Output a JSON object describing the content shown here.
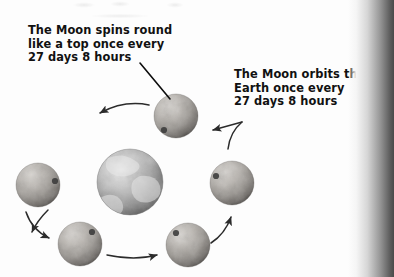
{
  "page": {
    "background_color": "#fdfdfd",
    "width": 394,
    "height": 277
  },
  "captions": [
    {
      "id": "spin",
      "text": "The Moon spins round\nlike a top once every\n27 days 8 hours",
      "lines": [
        "The Moon spins round",
        "like a top once every",
        "27 days 8 hours"
      ],
      "color": "#111111",
      "points_to": "top-moon"
    },
    {
      "id": "orbit",
      "text": "The Moon orbits the\nEarth once every\n27 days 8 hours",
      "lines": [
        "The Moon orbits the",
        "Earth once every",
        "27 days 8 hours"
      ],
      "color": "#111111",
      "points_to": "orbit-path"
    }
  ],
  "diagram": {
    "type": "orbit-diagram",
    "period_label": "27 days 8 hours",
    "orbit_direction": "counterclockwise",
    "earth": {
      "label": "Earth",
      "center_x": 130,
      "center_y": 182,
      "radius": 33,
      "color": "#9a9a9a"
    },
    "moons": [
      {
        "label": "Moon",
        "position": "top",
        "center_x": 176,
        "center_y": 116,
        "radius": 22,
        "crater_angle_deg": 215,
        "color": "#a9a6a2"
      },
      {
        "label": "Moon",
        "position": "upper-left",
        "center_x": 38,
        "center_y": 185,
        "radius": 22,
        "crater_angle_deg": 20,
        "color": "#a9a6a2"
      },
      {
        "label": "Moon",
        "position": "lower-left",
        "center_x": 80,
        "center_y": 244,
        "radius": 22,
        "crater_angle_deg": 315,
        "color": "#a9a6a2"
      },
      {
        "label": "Moon",
        "position": "lower-right",
        "center_x": 188,
        "center_y": 245,
        "radius": 22,
        "crater_angle_deg": 225,
        "color": "#a9a6a2"
      },
      {
        "label": "Moon",
        "position": "right",
        "center_x": 232,
        "center_y": 183,
        "radius": 22,
        "crater_angle_deg": 200,
        "color": "#a9a6a2"
      }
    ],
    "arrows": [
      {
        "id": "arrow-top",
        "from": "top-moon",
        "to": "upper-left-moon",
        "direction": "left"
      },
      {
        "id": "arrow-upper-left",
        "from": "upper-left-moon",
        "to": "left-moon",
        "direction": "down-left"
      },
      {
        "id": "arrow-lower-left",
        "from": "left-moon",
        "to": "lower-left-moon",
        "direction": "down-right"
      },
      {
        "id": "arrow-bottom",
        "from": "lower-left-moon",
        "to": "lower-right-moon",
        "direction": "right"
      },
      {
        "id": "arrow-right",
        "from": "lower-right-moon",
        "to": "right-moon",
        "direction": "up-right"
      }
    ]
  },
  "artifacts": {
    "gutter_shadow": "book-scan-gutter-shadow-right-edge",
    "scan_bleed": "faint-bleed-through-top-edge"
  }
}
